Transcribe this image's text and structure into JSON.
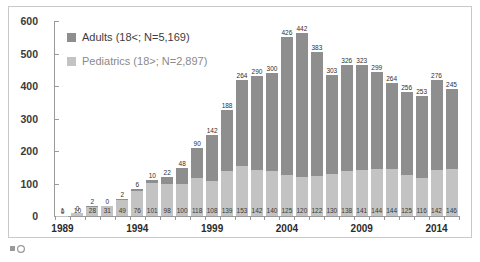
{
  "legend": {
    "position": "top-left",
    "entries": [
      {
        "label": "Adults (18<; N=5,169)",
        "color": "#8e8e8e"
      },
      {
        "label": "Pediatrics (18>; N=2,897)",
        "color": "#c3c3c3"
      }
    ]
  },
  "axis": {
    "y_ticks": [
      "0",
      "100",
      "200",
      "300",
      "400",
      "500",
      "600"
    ],
    "x_ticks": [
      "1989",
      "1994",
      "1999",
      "2004",
      "2009",
      "2014"
    ]
  },
  "chart_data": {
    "type": "bar",
    "stacked": true,
    "title": "",
    "xlabel": "",
    "ylabel": "",
    "ylim": [
      0,
      600
    ],
    "grid": false,
    "legend_position": "top-left",
    "categories": [
      "1989",
      "1990",
      "1991",
      "1992",
      "1993",
      "1994",
      "1995",
      "1996",
      "1997",
      "1998",
      "1999",
      "2000",
      "2001",
      "2002",
      "2003",
      "2004",
      "2005",
      "2006",
      "2007",
      "2008",
      "2009",
      "2010",
      "2011",
      "2012",
      "2013",
      "2014",
      "2015"
    ],
    "series": [
      {
        "name": "Pediatrics (18>; N=2,897)",
        "color": "#c3c3c3",
        "values": [
          1,
          10,
          28,
          31,
          49,
          76,
          101,
          98,
          100,
          118,
          108,
          139,
          153,
          142,
          140,
          125,
          120,
          122,
          130,
          138,
          141,
          144,
          144,
          125,
          116,
          142,
          146
        ]
      },
      {
        "name": "Adults (18<; N=5,169)",
        "color": "#8e8e8e",
        "values": [
          0,
          0,
          2,
          0,
          2,
          6,
          10,
          22,
          48,
          90,
          142,
          188,
          264,
          290,
          300,
          426,
          442,
          383,
          303,
          326,
          323,
          299,
          264,
          256,
          253,
          276,
          245
        ]
      }
    ]
  }
}
